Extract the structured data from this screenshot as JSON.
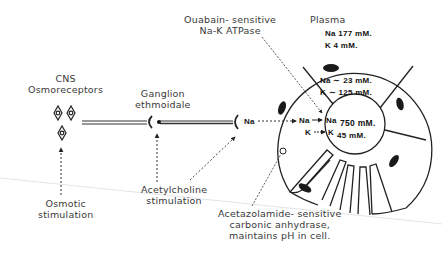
{
  "diagram": {
    "cns": {
      "title_line1": "CNS",
      "title_line2": "Osmoreceptors",
      "stimulus_line1": "Osmotic",
      "stimulus_line2": "stimulation"
    },
    "ganglion": {
      "title_line1": "Ganglion",
      "title_line2": "ethmoidale",
      "stimulus_line1": "Acetylcholine",
      "stimulus_line2": "stimulation"
    },
    "nerve_ending_ion": "Na",
    "atpase": {
      "line1": "Ouabain- sensitive",
      "line2": "Na-K ATPase"
    },
    "plasma": {
      "title": "Plasma",
      "na": "Na  177 mM.",
      "k": "K   4 mM."
    },
    "cell": {
      "na": "Na ∼ 23 mM.",
      "k": "K ∼ 125 mM."
    },
    "lumen": {
      "na_in": "Na",
      "na_out": "Na",
      "na_conc": "750 mM.",
      "k_in": "K",
      "k_out": "K",
      "k_conc": "45 mM."
    },
    "carbonic_anhydrase": {
      "line1": "Acetazolamide- sensitive",
      "line2": "carbonic   anhydrase,",
      "line3": "maintains pH in cell."
    }
  }
}
